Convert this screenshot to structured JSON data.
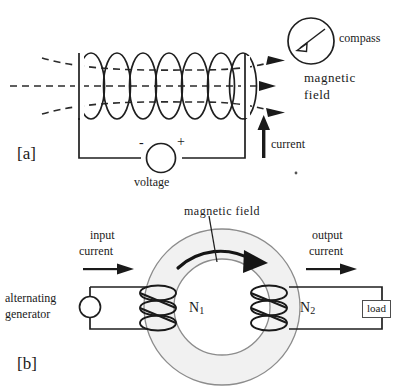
{
  "figure": {
    "panel_a": {
      "tag": "[a]",
      "labels": {
        "compass": "compass",
        "magnetic_field_line1": "magnetic",
        "magnetic_field_line2": "field",
        "current": "current",
        "voltage": "voltage",
        "terminal_negative": "-",
        "terminal_positive": "+"
      },
      "counts": {
        "coil_turns": 7,
        "field_lines": 3
      }
    },
    "panel_b": {
      "tag": "[b]",
      "labels": {
        "magnetic_field": "magnetic field",
        "input_current_line1": "input",
        "input_current_line2": "current",
        "output_current_line1": "output",
        "output_current_line2": "current",
        "alternating_generator_line1": "alternating",
        "alternating_generator_line2": "generator",
        "primary_windings": "N",
        "primary_windings_sub": "1",
        "secondary_windings": "N",
        "secondary_windings_sub": "2",
        "load": "load"
      },
      "counts": {
        "primary_turns": 3,
        "secondary_turns": 3
      }
    }
  },
  "colors": {
    "ink": "#1a1a1a",
    "line": "#262626",
    "core_fill": "#f0f0f0",
    "core_stroke": "#808080",
    "dashed_field": "#333333",
    "background": "#ffffff"
  }
}
